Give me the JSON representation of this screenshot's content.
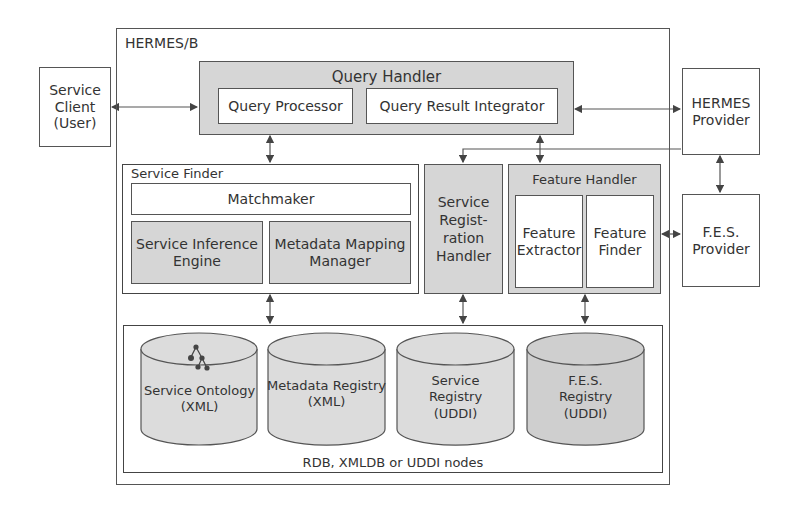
{
  "outer": {
    "title": "HERMES/B"
  },
  "service_client": {
    "label_lines": [
      "Service",
      "Client",
      "(User)"
    ]
  },
  "query_handler": {
    "title": "Query Handler",
    "processor": "Query Processor",
    "integrator": "Query Result Integrator"
  },
  "hermes_provider": {
    "label_lines": [
      "HERMES",
      "Provider"
    ]
  },
  "fes_provider": {
    "label_lines": [
      "F.E.S.",
      "Provider"
    ]
  },
  "service_finder": {
    "title": "Service Finder",
    "matchmaker": "Matchmaker",
    "inference_lines": [
      "Service Inference",
      "Engine"
    ],
    "mapping_lines": [
      "Metadata Mapping",
      "Manager"
    ]
  },
  "registration_handler": {
    "label_lines": [
      "Service",
      "Regist-",
      "ration",
      "Handler"
    ]
  },
  "feature_handler": {
    "title": "Feature Handler",
    "extractor_lines": [
      "Feature",
      "Extractor"
    ],
    "finder_lines": [
      "Feature",
      "Finder"
    ]
  },
  "storage": {
    "caption": "RDB, XMLDB or UDDI nodes",
    "databases": [
      {
        "lines": [
          "Service Ontology",
          "(XML)"
        ],
        "icon": "ontology-tree-icon"
      },
      {
        "lines": [
          "Metadata Registry",
          "(XML)"
        ]
      },
      {
        "lines": [
          "Service",
          "Registry",
          "(UDDI)"
        ]
      },
      {
        "lines": [
          "F.E.S.",
          "Registry",
          "(UDDI)"
        ]
      }
    ]
  },
  "colors": {
    "line": "#555555",
    "gray_fill": "#d6d6d6",
    "cylinder_fill": "#dcdcdc",
    "cylinder_dark_fill": "#cfcfcf"
  }
}
